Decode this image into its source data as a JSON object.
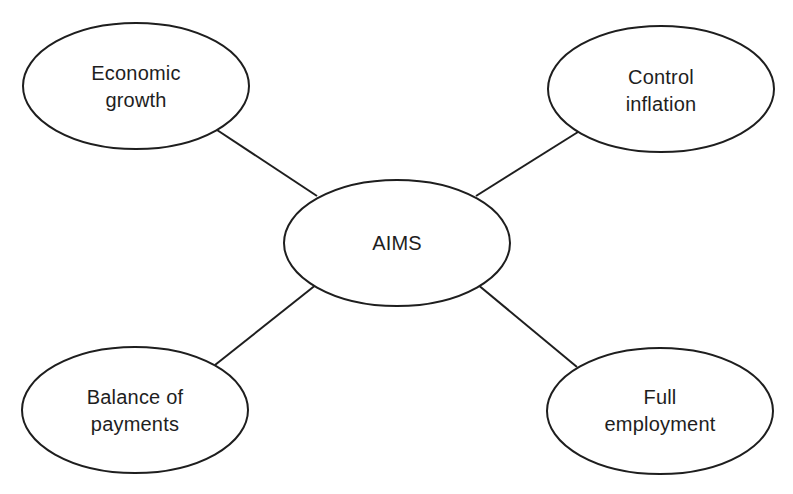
{
  "diagram": {
    "type": "mind-map",
    "stroke_color": "#1e1e1e",
    "fill_color": "#ffffff",
    "background": "#ffffff",
    "center": {
      "id": "aims",
      "lines": [
        "AIMS"
      ],
      "cx": 397,
      "cy": 243,
      "rx": 113,
      "ry": 63
    },
    "nodes": [
      {
        "id": "economic-growth",
        "lines": [
          "Economic",
          "growth"
        ],
        "cx": 136,
        "cy": 86,
        "rx": 113,
        "ry": 63,
        "connector": {
          "x1": 214,
          "y1": 128,
          "x2": 317,
          "y2": 196
        }
      },
      {
        "id": "control-inflation",
        "lines": [
          "Control",
          "inflation"
        ],
        "cx": 661,
        "cy": 89,
        "rx": 113,
        "ry": 63,
        "connector": {
          "x1": 578,
          "y1": 132,
          "x2": 476,
          "y2": 196
        }
      },
      {
        "id": "balance-of-payments",
        "lines": [
          "Balance of",
          "payments"
        ],
        "cx": 135,
        "cy": 410,
        "rx": 113,
        "ry": 63,
        "connector": {
          "x1": 215,
          "y1": 365,
          "x2": 317,
          "y2": 284
        }
      },
      {
        "id": "full-employment",
        "lines": [
          "Full",
          "employment"
        ],
        "cx": 660,
        "cy": 411,
        "rx": 113,
        "ry": 63,
        "connector": {
          "x1": 577,
          "y1": 367,
          "x2": 477,
          "y2": 284
        }
      }
    ]
  }
}
